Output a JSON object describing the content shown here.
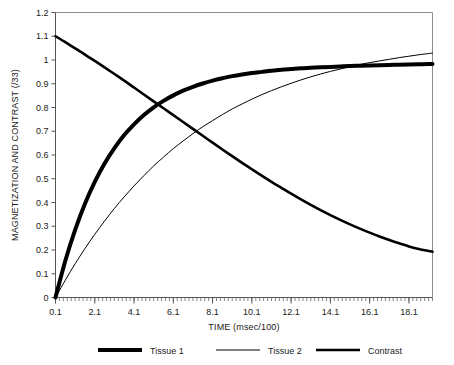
{
  "chart_data": {
    "type": "line",
    "title": "",
    "xlabel": "TIME (msec/100)",
    "ylabel": "MAGNETIZATION AND CONTRAST (/33)",
    "xlim": [
      0.1,
      19.3
    ],
    "ylim": [
      0,
      1.2
    ],
    "grid": false,
    "legend_position": "bottom",
    "x_tick_labels": [
      "0.1",
      "2.1",
      "4.1",
      "6.1",
      "8.1",
      "10.1",
      "12.1",
      "14.1",
      "16.1",
      "18.1"
    ],
    "x_tick_values": [
      0.1,
      2.1,
      4.1,
      6.1,
      8.1,
      10.1,
      12.1,
      14.1,
      16.1,
      18.1
    ],
    "y_tick_labels": [
      "0",
      "0.1",
      "0.2",
      "0.3",
      "0.4",
      "0.5",
      "0.6",
      "0.7",
      "0.8",
      "0.9",
      "1",
      "1.1",
      "1.2"
    ],
    "y_tick_values": [
      0,
      0.1,
      0.2,
      0.3,
      0.4,
      0.5,
      0.6,
      0.7,
      0.8,
      0.9,
      1.0,
      1.1,
      1.2
    ],
    "x": [
      0.1,
      0.6,
      1.1,
      1.6,
      2.1,
      2.6,
      3.1,
      3.6,
      4.1,
      4.6,
      5.1,
      5.6,
      6.1,
      6.6,
      7.1,
      7.6,
      8.1,
      8.6,
      9.1,
      9.6,
      10.1,
      10.6,
      11.1,
      11.6,
      12.1,
      12.6,
      13.1,
      13.6,
      14.1,
      14.6,
      15.1,
      15.6,
      16.1,
      16.6,
      17.1,
      17.6,
      18.1,
      18.6,
      19.1,
      19.3
    ],
    "series": [
      {
        "name": "Tissue 1",
        "style": "thick",
        "stroke_width": 4.0,
        "color": "#000000",
        "values": [
          0.0,
          0.155,
          0.285,
          0.395,
          0.487,
          0.564,
          0.629,
          0.684,
          0.729,
          0.768,
          0.801,
          0.828,
          0.851,
          0.871,
          0.887,
          0.901,
          0.913,
          0.923,
          0.932,
          0.939,
          0.945,
          0.95,
          0.955,
          0.959,
          0.962,
          0.965,
          0.967,
          0.969,
          0.971,
          0.973,
          0.975,
          0.976,
          0.977,
          0.978,
          0.979,
          0.98,
          0.981,
          0.982,
          0.983,
          0.983
        ]
      },
      {
        "name": "Tissue 2",
        "style": "thin",
        "stroke_width": 1.0,
        "color": "#000000",
        "values": [
          0.0,
          0.073,
          0.142,
          0.206,
          0.266,
          0.322,
          0.375,
          0.424,
          0.47,
          0.513,
          0.554,
          0.591,
          0.627,
          0.659,
          0.69,
          0.719,
          0.745,
          0.77,
          0.794,
          0.815,
          0.835,
          0.854,
          0.871,
          0.887,
          0.902,
          0.916,
          0.929,
          0.941,
          0.952,
          0.962,
          0.972,
          0.981,
          0.989,
          0.996,
          1.003,
          1.01,
          1.016,
          1.022,
          1.027,
          1.029
        ]
      },
      {
        "name": "Contrast",
        "style": "medium",
        "stroke_width": 2.6,
        "color": "#000000",
        "values": [
          1.1,
          1.075,
          1.049,
          1.023,
          0.996,
          0.969,
          0.941,
          0.913,
          0.884,
          0.855,
          0.826,
          0.797,
          0.768,
          0.739,
          0.71,
          0.681,
          0.652,
          0.623,
          0.595,
          0.567,
          0.54,
          0.513,
          0.487,
          0.462,
          0.437,
          0.413,
          0.39,
          0.368,
          0.347,
          0.327,
          0.308,
          0.29,
          0.273,
          0.257,
          0.242,
          0.228,
          0.215,
          0.204,
          0.196,
          0.193
        ]
      }
    ],
    "legend": [
      {
        "label": "Tissue 1",
        "style": "thick"
      },
      {
        "label": "Tissue 2",
        "style": "thin"
      },
      {
        "label": "Contrast",
        "style": "medium"
      }
    ]
  }
}
